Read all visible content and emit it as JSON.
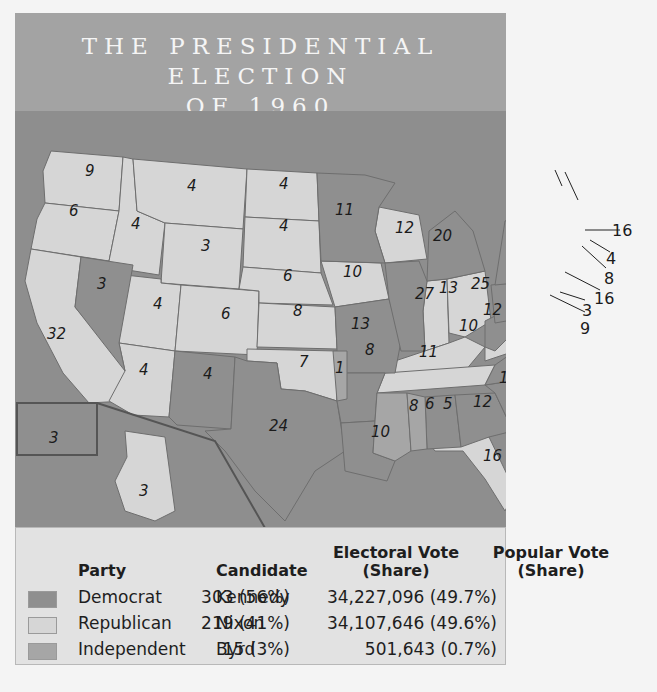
{
  "title": {
    "line1": "THE PRESIDENTIAL ELECTION",
    "line2": "OF 1960"
  },
  "colors": {
    "democrat": "#8f8f8f",
    "republican": "#d6d6d6",
    "independent": "#a6a6a6",
    "water": "#8e8e8e",
    "title_bg": "#a3a3a3",
    "legend_bg": "#e2e2e2"
  },
  "map": {
    "states": [
      {
        "abbr": "WA",
        "votes": "9",
        "party": "republican"
      },
      {
        "abbr": "OR",
        "votes": "6",
        "party": "republican"
      },
      {
        "abbr": "CA",
        "votes": "32",
        "party": "republican"
      },
      {
        "abbr": "NV",
        "votes": "3",
        "party": "democrat"
      },
      {
        "abbr": "ID",
        "votes": "4",
        "party": "republican"
      },
      {
        "abbr": "MT",
        "votes": "4",
        "party": "republican"
      },
      {
        "abbr": "WY",
        "votes": "3",
        "party": "republican"
      },
      {
        "abbr": "UT",
        "votes": "4",
        "party": "republican"
      },
      {
        "abbr": "CO",
        "votes": "6",
        "party": "republican"
      },
      {
        "abbr": "AZ",
        "votes": "4",
        "party": "republican"
      },
      {
        "abbr": "NM",
        "votes": "4",
        "party": "democrat"
      },
      {
        "abbr": "ND",
        "votes": "4",
        "party": "republican"
      },
      {
        "abbr": "SD",
        "votes": "4",
        "party": "republican"
      },
      {
        "abbr": "NE",
        "votes": "6",
        "party": "republican"
      },
      {
        "abbr": "KS",
        "votes": "8",
        "party": "republican"
      },
      {
        "abbr": "OK",
        "votes": "7",
        "party": "republican"
      },
      {
        "abbr": "OK-Byrd",
        "votes": "1",
        "party": "independent"
      },
      {
        "abbr": "TX",
        "votes": "24",
        "party": "democrat"
      },
      {
        "abbr": "MN",
        "votes": "11",
        "party": "democrat"
      },
      {
        "abbr": "IA",
        "votes": "10",
        "party": "republican"
      },
      {
        "abbr": "MO",
        "votes": "13",
        "party": "democrat"
      },
      {
        "abbr": "AR",
        "votes": "8",
        "party": "democrat"
      },
      {
        "abbr": "LA",
        "votes": "10",
        "party": "democrat"
      },
      {
        "abbr": "WI",
        "votes": "12",
        "party": "republican"
      },
      {
        "abbr": "IL",
        "votes": "27",
        "party": "democrat"
      },
      {
        "abbr": "MI",
        "votes": "20",
        "party": "democrat"
      },
      {
        "abbr": "IN",
        "votes": "13",
        "party": "republican"
      },
      {
        "abbr": "OH",
        "votes": "25",
        "party": "republican"
      },
      {
        "abbr": "KY",
        "votes": "10",
        "party": "republican"
      },
      {
        "abbr": "TN",
        "votes": "11",
        "party": "republican"
      },
      {
        "abbr": "MS",
        "votes": "8",
        "party": "independent"
      },
      {
        "abbr": "AL",
        "votes": "6",
        "party": "independent"
      },
      {
        "abbr": "AL-Dem",
        "votes": "5",
        "party": "democrat"
      },
      {
        "abbr": "GA",
        "votes": "12",
        "party": "democrat"
      },
      {
        "abbr": "FL",
        "votes": "10",
        "party": "republican"
      },
      {
        "abbr": "SC",
        "votes": "8",
        "party": "democrat"
      },
      {
        "abbr": "NC",
        "votes": "14",
        "party": "democrat"
      },
      {
        "abbr": "VA",
        "votes": "12",
        "party": "republican"
      },
      {
        "abbr": "WV",
        "votes": "8",
        "party": "democrat"
      },
      {
        "abbr": "PA",
        "votes": "32",
        "party": "democrat"
      },
      {
        "abbr": "NY",
        "votes": "45",
        "party": "democrat"
      },
      {
        "abbr": "VT",
        "votes": "3",
        "party": "republican"
      },
      {
        "abbr": "NH",
        "votes": "4",
        "party": "republican"
      },
      {
        "abbr": "ME",
        "votes": "5",
        "party": "republican"
      },
      {
        "abbr": "MA",
        "votes": "16",
        "party": "democrat"
      },
      {
        "abbr": "RI",
        "votes": "4",
        "party": "democrat"
      },
      {
        "abbr": "CT",
        "votes": "8",
        "party": "democrat"
      },
      {
        "abbr": "NJ",
        "votes": "16",
        "party": "democrat"
      },
      {
        "abbr": "DE",
        "votes": "3",
        "party": "democrat"
      },
      {
        "abbr": "MD",
        "votes": "9",
        "party": "democrat"
      },
      {
        "abbr": "AK",
        "votes": "3",
        "party": "republican"
      },
      {
        "abbr": "HI",
        "votes": "3",
        "party": "democrat"
      }
    ]
  },
  "legend": {
    "headers": {
      "party": "Party",
      "candidate": "Candidate",
      "electoral_line1": "Electoral Vote",
      "electoral_line2": "(Share)",
      "popular_line1": "Popular Vote",
      "popular_line2": "(Share)"
    },
    "rows": [
      {
        "party": "Democrat",
        "candidate": "Kennedy",
        "electoral": "303 (56%)",
        "popular": "34,227,096 (49.7%)",
        "color": "#8f8f8f"
      },
      {
        "party": "Republican",
        "candidate": "Nixon",
        "electoral": "219 (41%)",
        "popular": "34,107,646 (49.6%)",
        "color": "#d6d6d6"
      },
      {
        "party": "Independent",
        "candidate": "Byrd",
        "electoral": "15 (3%)",
        "popular": "501,643 (0.7%)",
        "color": "#a6a6a6"
      }
    ]
  }
}
